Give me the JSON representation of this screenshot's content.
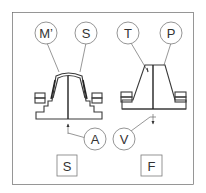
{
  "diagram": {
    "left_figure": {
      "callouts": [
        {
          "id": "m-prime",
          "label": "M’"
        },
        {
          "id": "s-top",
          "label": "S"
        },
        {
          "id": "a",
          "label": "A"
        }
      ],
      "caption": "S"
    },
    "right_figure": {
      "callouts": [
        {
          "id": "t",
          "label": "T"
        },
        {
          "id": "p",
          "label": "P"
        },
        {
          "id": "v",
          "label": "V"
        }
      ],
      "caption": "F"
    },
    "colors": {
      "line": "#3a3a3a",
      "callout_stroke": "#7a7a7a",
      "background": "#ffffff"
    }
  }
}
